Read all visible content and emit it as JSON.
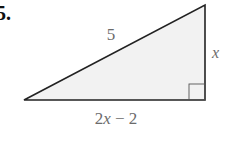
{
  "problem": {
    "number_fragment": "5.",
    "figure": {
      "shape": "right-triangle",
      "fill_color": "#f2f2f2",
      "stroke_color": "#222222",
      "hypotenuse_label": "5",
      "vertical_leg_label": "x",
      "horizontal_leg_label": "2x − 2",
      "right_angle_marker": "bottom-right"
    }
  }
}
